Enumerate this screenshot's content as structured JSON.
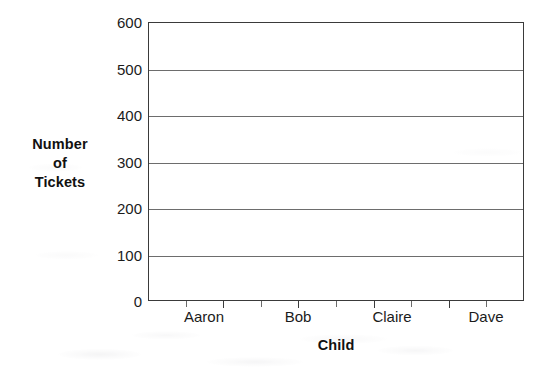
{
  "chart_data": {
    "type": "bar",
    "title": "",
    "subtitle": "",
    "xlabel": "Child",
    "ylabel": "Number of Tickets",
    "ylabel_lines": [
      "Number",
      "of",
      "Tickets"
    ],
    "categories": [
      "Aaron",
      "Bob",
      "Claire",
      "Dave"
    ],
    "values": [
      null,
      null,
      null,
      null
    ],
    "series": [
      {
        "name": "Number of Tickets",
        "values": [
          null,
          null,
          null,
          null
        ]
      }
    ],
    "ylim": [
      0,
      600
    ],
    "ytick_step": 100,
    "yticks": [
      0,
      100,
      200,
      300,
      400,
      500,
      600
    ],
    "ytick_labels": [
      "0",
      "100",
      "200",
      "300",
      "400",
      "500",
      "600"
    ],
    "xticks": [
      "Aaron",
      "Bob",
      "Claire",
      "Dave"
    ],
    "grid": "horizontal",
    "grid_on": true,
    "legend": "none",
    "legend_position": "none",
    "annotations": [],
    "note": "Blank bar-chart grid: axes and gridlines drawn, no bars plotted"
  },
  "axes": {
    "y": {
      "label_lines": [
        "Number",
        "of",
        "Tickets"
      ],
      "ticks": [
        {
          "value": 600,
          "label": "600"
        },
        {
          "value": 500,
          "label": "500"
        },
        {
          "value": 400,
          "label": "400"
        },
        {
          "value": 300,
          "label": "300"
        },
        {
          "value": 200,
          "label": "200"
        },
        {
          "value": 100,
          "label": "100"
        },
        {
          "value": 0,
          "label": "0"
        }
      ]
    },
    "x": {
      "label": "Child",
      "categories": [
        {
          "label": "Aaron"
        },
        {
          "label": "Bob"
        },
        {
          "label": "Claire"
        },
        {
          "label": "Dave"
        }
      ]
    }
  },
  "colors": {
    "axis": "#3a3a3a",
    "gridline": "#6d6d6d",
    "text": "#1b1b1b",
    "title_text": "#111111",
    "background": "#ffffff"
  }
}
